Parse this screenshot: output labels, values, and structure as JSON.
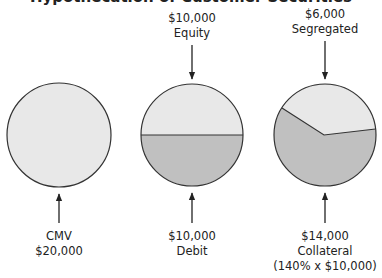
{
  "title": "Hypothecation of Customer Securities",
  "colors": {
    "light_fill": "#e8e8e8",
    "dark_fill": "#c0c0c0",
    "stroke": "#333333",
    "text": "#222222",
    "background": "#ffffff"
  },
  "pies": [
    {
      "id": "cmv",
      "top_labels": [],
      "bottom_labels": [
        "CMV",
        "$20,000"
      ],
      "segments": [
        {
          "name": "market-value",
          "value": 20000,
          "fill": "light"
        }
      ]
    },
    {
      "id": "margin-account",
      "top_labels": [
        "$10,000",
        "Equity"
      ],
      "bottom_labels": [
        "$10,000",
        "Debit"
      ],
      "segments": [
        {
          "name": "equity",
          "value": 10000,
          "fill": "light"
        },
        {
          "name": "debit",
          "value": 10000,
          "fill": "dark"
        }
      ]
    },
    {
      "id": "hypothecation",
      "top_labels": [
        "$6,000",
        "Segregated"
      ],
      "bottom_labels": [
        "$14,000",
        "Collateral",
        "(140% x $10,000)"
      ],
      "segments": [
        {
          "name": "segregated",
          "value": 6000,
          "fill": "light"
        },
        {
          "name": "collateral",
          "value": 14000,
          "fill": "dark"
        }
      ]
    }
  ]
}
